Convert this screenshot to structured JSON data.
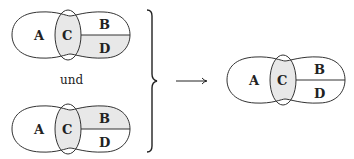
{
  "diagram": {
    "connector_word": "und",
    "shade_color": "#e8e8e8",
    "stroke_color": "#333333",
    "shapes": [
      {
        "id": "top",
        "labels": {
          "A": "A",
          "C": "C",
          "B": "B",
          "D": "D"
        },
        "shaded": [
          "C",
          "D"
        ]
      },
      {
        "id": "bottom",
        "labels": {
          "A": "A",
          "C": "C",
          "B": "B",
          "D": "D"
        },
        "shaded": [
          "C",
          "B"
        ]
      },
      {
        "id": "result",
        "labels": {
          "A": "A",
          "C": "C",
          "B": "B",
          "D": "D"
        },
        "shaded": [
          "C"
        ]
      }
    ],
    "brace": "right-curly-brace",
    "arrow": "right-arrow"
  }
}
